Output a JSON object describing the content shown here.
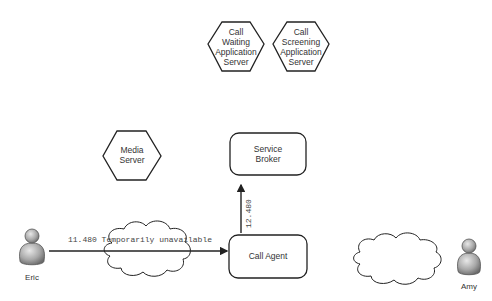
{
  "nodes": {
    "call_waiting": {
      "lines": [
        "Call",
        "Waiting",
        "Application",
        "Server"
      ],
      "shape": "hexagon"
    },
    "call_screening": {
      "lines": [
        "Call",
        "Screening",
        "Application",
        "Server"
      ],
      "shape": "hexagon"
    },
    "media_server": {
      "lines": [
        "Media",
        "Server"
      ],
      "shape": "hexagon"
    },
    "service_broker": {
      "lines": [
        "Service",
        "Broker"
      ],
      "shape": "rounded-rect"
    },
    "call_agent": {
      "lines": [
        "Call Agent"
      ],
      "shape": "rounded-rect"
    }
  },
  "actors": {
    "eric": {
      "label": "Eric",
      "icon": "person-icon"
    },
    "amy": {
      "label": "Amy",
      "icon": "person-icon"
    }
  },
  "clouds": [
    {
      "name": "left-network-cloud",
      "icon": "cloud-icon"
    },
    {
      "name": "right-network-cloud",
      "icon": "cloud-icon"
    }
  ],
  "edges": {
    "eric_to_agent": {
      "label": "11.480 Temporarily unavailable",
      "from": "Eric",
      "to": "Call Agent"
    },
    "agent_to_broker": {
      "label": "12.480",
      "from": "Call Agent",
      "to": "Service Broker"
    }
  },
  "colors": {
    "stroke": "#222222",
    "text": "#333333",
    "person_fill": "#9a9a9a",
    "background": "#ffffff"
  }
}
